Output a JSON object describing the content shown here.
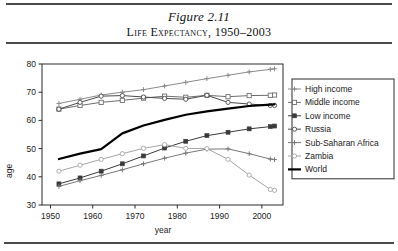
{
  "figure": {
    "number": "Figure 2.11",
    "title": "Life Expectancy, 1950–2003"
  },
  "chart_data": {
    "type": "line",
    "title": "Life Expectancy, 1950–2003",
    "xlabel": "year",
    "ylabel": "age",
    "xlim": [
      1948,
      2005
    ],
    "ylim": [
      30,
      80
    ],
    "xticks": [
      1950,
      1960,
      1970,
      1980,
      1990,
      2000
    ],
    "yticks": [
      30,
      40,
      50,
      60,
      70,
      80
    ],
    "xtick_labels": [
      "1950",
      "1960",
      "1970",
      "1980",
      "1990",
      "2000"
    ],
    "ytick_labels": [
      "30",
      "40",
      "50",
      "60",
      "70",
      "80"
    ],
    "grid": false,
    "legend_position": "right-outside",
    "x": [
      1952,
      1957,
      1962,
      1967,
      1972,
      1977,
      1982,
      1987,
      1992,
      1997,
      2002,
      2003
    ],
    "series": [
      {
        "name": "High income",
        "color": "#8a8a8a",
        "marker": "plus",
        "width": 1.0,
        "values": [
          66.0,
          67.5,
          69.0,
          70.0,
          70.9,
          72.2,
          73.5,
          74.8,
          76.0,
          77.2,
          78.1,
          78.3
        ]
      },
      {
        "name": "Middle income",
        "color": "#6e6e6e",
        "marker": "square-open",
        "width": 1.0,
        "values": [
          64.0,
          65.3,
          66.4,
          67.1,
          67.9,
          68.6,
          68.2,
          68.9,
          68.4,
          68.8,
          68.9,
          69.0
        ]
      },
      {
        "name": "Low income",
        "color": "#3a3a3a",
        "marker": "square-filled",
        "width": 1.0,
        "values": [
          37.5,
          39.6,
          42.0,
          44.6,
          47.4,
          50.2,
          52.6,
          54.6,
          55.8,
          57.0,
          57.8,
          58.0
        ]
      },
      {
        "name": "Russia",
        "color": "#4a4a4a",
        "marker": "circle-open",
        "width": 1.0,
        "values": [
          64.0,
          66.4,
          68.6,
          68.8,
          68.3,
          67.8,
          67.5,
          68.9,
          66.4,
          65.8,
          65.3,
          65.3
        ]
      },
      {
        "name": "Sub-Saharan Africa",
        "color": "#777777",
        "marker": "plus",
        "width": 1.0,
        "values": [
          36.6,
          38.6,
          40.5,
          42.5,
          44.6,
          46.6,
          48.4,
          49.8,
          49.9,
          48.2,
          46.3,
          46.1
        ]
      },
      {
        "name": "Zambia",
        "color": "#a5a5a5",
        "marker": "circle-open",
        "width": 1.0,
        "values": [
          42.0,
          44.1,
          46.2,
          48.2,
          50.1,
          51.4,
          50.1,
          50.0,
          46.2,
          40.6,
          35.5,
          35.2
        ]
      },
      {
        "name": "World",
        "color": "#000000",
        "marker": "none",
        "width": 2.2,
        "values": [
          46.3,
          48.2,
          49.8,
          55.4,
          58.2,
          60.2,
          62.0,
          63.2,
          64.2,
          65.1,
          65.6,
          65.7
        ]
      }
    ]
  }
}
